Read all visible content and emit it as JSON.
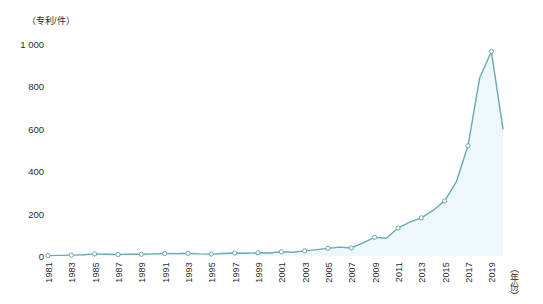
{
  "chart_data": {
    "type": "area",
    "title": "",
    "subtitle": "",
    "xlabel": "（年份）",
    "ylabel": "（专利/件）",
    "ylim": [
      0,
      1000
    ],
    "xlim": [
      1981,
      2020
    ],
    "grid": false,
    "legend": null,
    "y_ticks": [
      "0",
      "200",
      "400",
      "600",
      "800",
      "1 000"
    ],
    "y_tick_values": [
      0,
      200,
      400,
      600,
      800,
      1000
    ],
    "x_ticks": [
      "1981",
      "1983",
      "1985",
      "1987",
      "1989",
      "1991",
      "1993",
      "1995",
      "1997",
      "1999",
      "2001",
      "2003",
      "2005",
      "2007",
      "2009",
      "2011",
      "2013",
      "2015",
      "2017",
      "2019"
    ],
    "x_tick_values": [
      1981,
      1983,
      1985,
      1987,
      1989,
      1991,
      1993,
      1995,
      1997,
      1999,
      2001,
      2003,
      2005,
      2007,
      2009,
      2011,
      2013,
      2015,
      2017,
      2019
    ],
    "marker_interval_years": 2,
    "line_color": "#6aa9b4",
    "fill_color": "#eef8fa",
    "marker_color": "#ffffff",
    "series": [
      {
        "name": "专利申请量",
        "x": [
          1981,
          1982,
          1983,
          1984,
          1985,
          1986,
          1987,
          1988,
          1989,
          1990,
          1991,
          1992,
          1993,
          1994,
          1995,
          1996,
          1997,
          1998,
          1999,
          2000,
          2001,
          2002,
          2003,
          2004,
          2005,
          2006,
          2007,
          2008,
          2009,
          2010,
          2011,
          2012,
          2013,
          2014,
          2015,
          2016,
          2017,
          2018,
          2019,
          2020
        ],
        "values": [
          2,
          3,
          4,
          6,
          10,
          8,
          7,
          9,
          8,
          10,
          12,
          11,
          13,
          10,
          9,
          12,
          14,
          13,
          15,
          14,
          20,
          18,
          24,
          30,
          36,
          42,
          38,
          62,
          88,
          84,
          132,
          160,
          180,
          215,
          260,
          350,
          520,
          840,
          965,
          600
        ]
      }
    ]
  },
  "axes": {
    "y_unit_label": "（专利/件）",
    "x_unit_label": "（年份）"
  }
}
